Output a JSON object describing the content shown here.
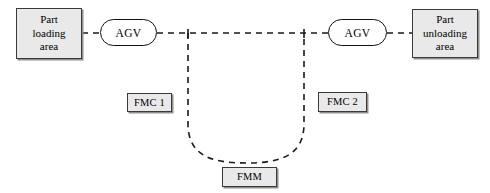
{
  "diagram": {
    "canvas": {
      "width": 490,
      "height": 193,
      "background": "#ffffff"
    },
    "style": {
      "box_fill": "#e9e9e9",
      "box_border": "#3a3a3a",
      "box_shadow": "#8f8f8f",
      "node_border": "#111111",
      "path_color": "#1a1a1a",
      "path_dash": "6 5",
      "path_width": 1.6
    },
    "nodes": {
      "part_loading": {
        "label": "Part\nloading\narea",
        "shape": "rectangle"
      },
      "agv_left": {
        "label": "AGV",
        "shape": "stadium"
      },
      "agv_right": {
        "label": "AGV",
        "shape": "stadium"
      },
      "part_unloading": {
        "label": "Part\nunloading\narea",
        "shape": "rectangle"
      },
      "fmc_1": {
        "label": "FMC 1",
        "shape": "rectangle"
      },
      "fmc_2": {
        "label": "FMC 2",
        "shape": "rectangle"
      },
      "fmm": {
        "label": "FMM",
        "shape": "rectangle"
      }
    },
    "connections": [
      {
        "from": "part_loading",
        "to": "agv_left",
        "style": "dashed"
      },
      {
        "from": "agv_left",
        "to": "agv_right",
        "style": "dashed"
      },
      {
        "from": "agv_right",
        "to": "part_unloading",
        "style": "dashed"
      },
      {
        "from": "trunk_left_junction",
        "to": "fmm_loop",
        "style": "dashed"
      },
      {
        "from": "trunk_right_junction",
        "to": "fmm_loop",
        "style": "dashed"
      }
    ]
  }
}
